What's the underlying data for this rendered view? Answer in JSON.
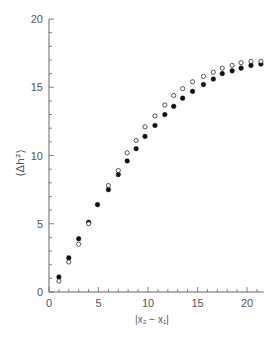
{
  "chart_data": {
    "type": "scatter",
    "title": "",
    "xlabel": "|x₂ − x₁|",
    "ylabel": "⟨Δh²⟩",
    "xlim": [
      0,
      21.7
    ],
    "ylim": [
      0,
      20
    ],
    "xticks": [
      0,
      5,
      10,
      15,
      20
    ],
    "yticks": [
      0,
      5,
      10,
      15,
      20
    ],
    "grid": false,
    "legend": null,
    "series": [
      {
        "name": "filled",
        "marker": "filled-circle",
        "color": "#111111",
        "x": [
          1.0,
          2.0,
          3.0,
          4.0,
          4.9,
          6.0,
          7.0,
          7.9,
          8.8,
          9.7,
          10.7,
          11.7,
          12.6,
          13.5,
          14.5,
          15.6,
          16.6,
          17.5,
          18.5,
          19.4,
          20.4,
          21.4
        ],
        "y": [
          1.1,
          2.5,
          3.9,
          5.1,
          6.4,
          7.5,
          8.6,
          9.6,
          10.5,
          11.4,
          12.2,
          13.0,
          13.6,
          14.2,
          14.7,
          15.2,
          15.6,
          16.0,
          16.2,
          16.4,
          16.6,
          16.7
        ]
      },
      {
        "name": "open",
        "marker": "open-circle",
        "color": "#111111",
        "x": [
          1.0,
          2.0,
          3.0,
          4.0,
          6.0,
          7.0,
          7.9,
          8.8,
          9.7,
          10.7,
          11.7,
          12.6,
          13.5,
          14.5,
          15.6,
          16.6,
          17.5,
          18.5,
          19.4,
          20.4,
          21.4
        ],
        "y": [
          0.8,
          2.2,
          3.5,
          5.0,
          7.8,
          8.9,
          10.2,
          11.1,
          12.1,
          12.9,
          13.7,
          14.4,
          14.9,
          15.4,
          15.8,
          16.1,
          16.4,
          16.6,
          16.8,
          16.9,
          16.9
        ]
      }
    ]
  },
  "labels": {
    "x_axis": "|x₂ − x₁|",
    "y_axis": "⟨Δh²⟩"
  }
}
